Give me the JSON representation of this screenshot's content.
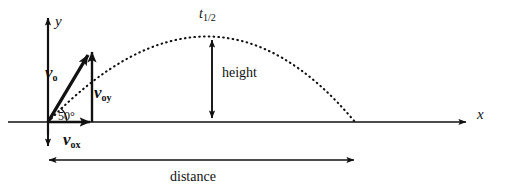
{
  "figure": {
    "axes": {
      "x_label": "x",
      "y_label": "y"
    },
    "labels": {
      "initial_velocity": "v",
      "initial_velocity_sub": "o",
      "velocity_y": "v",
      "velocity_y_sub": "oy",
      "velocity_x": "v",
      "velocity_x_sub": "ox",
      "angle": "50°",
      "height": "height",
      "distance": "distance",
      "half_time": "t",
      "half_time_sub": "1/2"
    },
    "colors": {
      "ink": "#111111",
      "background": "#ffffff"
    },
    "geometry": {
      "origin_x": 48,
      "origin_y": 122,
      "launch_angle_deg": 50,
      "apex_x": 212,
      "apex_y": 36,
      "landing_x": 355,
      "x_axis_end": 470,
      "y_axis_top": 14,
      "distance_arrow_y": 160,
      "distance_arrow_start": 45,
      "distance_arrow_end": 358,
      "v0_tip_x": 90,
      "v0_tip_y": 47,
      "voy_x": 92
    }
  }
}
